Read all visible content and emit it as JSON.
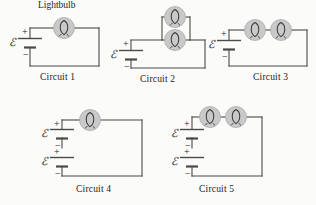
{
  "figure": {
    "background_color": "#fbfbf9",
    "wire_color": "#4a4a4a",
    "bulb_fill": "#c9c9c9",
    "bulb_stroke": "#8a8a8a",
    "filament_color": "#3a3a3a",
    "text_color": "#222222",
    "annotation": {
      "lightbulb_label": "Lightbulb"
    },
    "emf_symbol": "ℰ",
    "plus_symbol": "+",
    "minus_symbol": "−",
    "circuits": [
      {
        "id": "circuit-1",
        "caption": "Circuit 1",
        "batteries": 1,
        "bulbs": 1,
        "bulb_arrangement": "single",
        "battery_labels": [
          "ℰ"
        ]
      },
      {
        "id": "circuit-2",
        "caption": "Circuit 2",
        "batteries": 1,
        "bulbs": 2,
        "bulb_arrangement": "parallel",
        "battery_labels": [
          "ℰ"
        ]
      },
      {
        "id": "circuit-3",
        "caption": "Circuit 3",
        "batteries": 1,
        "bulbs": 2,
        "bulb_arrangement": "series",
        "battery_labels": [
          "ℰ"
        ]
      },
      {
        "id": "circuit-4",
        "caption": "Circuit 4",
        "batteries": 2,
        "bulbs": 1,
        "bulb_arrangement": "single",
        "battery_labels": [
          "ℰ",
          "ℰ"
        ]
      },
      {
        "id": "circuit-5",
        "caption": "Circuit 5",
        "batteries": 2,
        "bulbs": 2,
        "bulb_arrangement": "series",
        "battery_labels": [
          "ℰ",
          "ℰ"
        ]
      }
    ]
  }
}
